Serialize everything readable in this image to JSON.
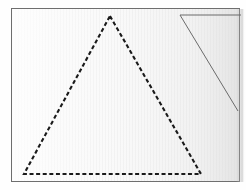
{
  "scene": {
    "title": "Dashed triangle drawn on lined paper",
    "canvas": {
      "width": 246,
      "height": 190,
      "background_color": "#fefefe"
    }
  },
  "paper": {
    "label": "paper-sheet",
    "x": 11,
    "y": 8,
    "width": 229,
    "height": 174,
    "fill_color": "#f7f7f7",
    "border_color": "#6e6e6e",
    "border_width": 1,
    "texture": "vertical-ruled-lines",
    "texture_color": "#eaeaea",
    "texture_spacing": 3,
    "shadow_color": "#cfcfcf"
  },
  "shapes": [
    {
      "name": "dashed-triangle",
      "type": "polygon",
      "style": "dashed",
      "stroke_color": "#1a1a1a",
      "stroke_width": 2.1,
      "dash_pattern": "4 2.6",
      "vertices": [
        {
          "label": "apex",
          "x": 110,
          "y": 16
        },
        {
          "label": "bottom-right",
          "x": 201,
          "y": 174
        },
        {
          "label": "bottom-left",
          "x": 24,
          "y": 174
        }
      ]
    },
    {
      "name": "solid-partial-triangle",
      "type": "polyline",
      "style": "solid",
      "stroke_color": "#6b6b6b",
      "stroke_width": 1,
      "vertices": [
        {
          "label": "top-right-end",
          "x": 241,
          "y": 15
        },
        {
          "label": "corner",
          "x": 180,
          "y": 15
        },
        {
          "label": "lower-right-end",
          "x": 238,
          "y": 111
        }
      ]
    }
  ]
}
